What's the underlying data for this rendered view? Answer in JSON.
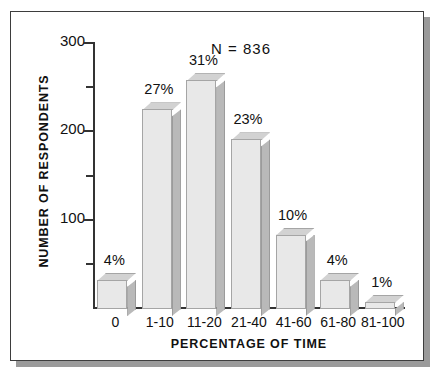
{
  "chart_data": {
    "type": "bar",
    "title": "",
    "xlabel": "PERCENTAGE OF TIME",
    "ylabel": "NUMBER OF RESPONDENTS",
    "categories": [
      "0",
      "1-10",
      "11-20",
      "21-40",
      "41-60",
      "61-80",
      "81-100"
    ],
    "values": [
      33,
      226,
      259,
      192,
      84,
      33,
      8
    ],
    "data_labels": [
      "4%",
      "27%",
      "31%",
      "23%",
      "10%",
      "4%",
      "1%"
    ],
    "ylim": [
      0,
      300
    ],
    "y_major_ticks": [
      100,
      200,
      300
    ],
    "y_major_tick_labels": [
      "100",
      "200",
      "300"
    ],
    "y_minor_ticks": [
      50,
      150,
      250
    ],
    "grid": false,
    "legend": "none",
    "annotation": "N  =  836",
    "style": "3d-bars-grayscale",
    "colors": {
      "bar_front": "#e8e8e8",
      "bar_side": "#b9b9b9",
      "bar_top": "#d2d2d2",
      "bar_outline": "#a5a5a5",
      "axis": "#333333",
      "text": "#111111",
      "frame": "#3d3d3d",
      "shadow": "#9a9a9a",
      "background": "#ffffff"
    }
  }
}
